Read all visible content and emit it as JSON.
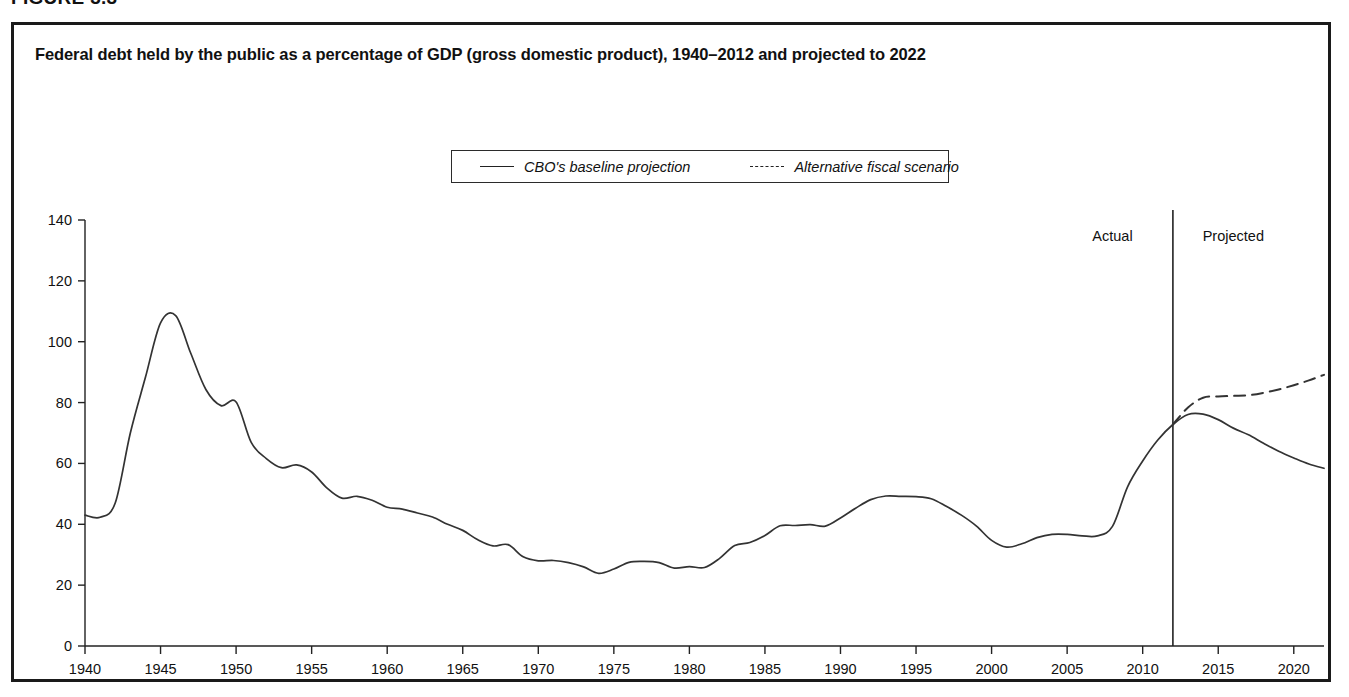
{
  "figure": {
    "number_label": "FIGURE 3.3",
    "title": "Federal debt held by the public as a percentage of GDP (gross domestic product), 1940–2012 and projected to 2022"
  },
  "legend": {
    "position": "top-center",
    "entries": [
      {
        "label": "CBO's baseline projection",
        "style": "solid",
        "color": "#333333"
      },
      {
        "label": "Alternative fiscal scenario",
        "style": "dashed",
        "color": "#333333"
      }
    ]
  },
  "annotations": {
    "actual_label": "Actual",
    "projected_label": "Projected",
    "divider_year": 2012
  },
  "chart_data": {
    "type": "line",
    "title": "Federal debt held by the public as a percentage of GDP (gross domestic product), 1940–2012 and projected to 2022",
    "xlabel": "",
    "ylabel": "",
    "xlim": [
      1940,
      2022
    ],
    "ylim": [
      0,
      140
    ],
    "grid": false,
    "legend_position": "top-center",
    "yticks": [
      0,
      20,
      40,
      60,
      80,
      100,
      120,
      140
    ],
    "ytick_labels": [
      "0",
      "20",
      "40",
      "60",
      "80",
      "100",
      "120",
      "140"
    ],
    "xticks": [
      1940,
      1945,
      1950,
      1955,
      1960,
      1965,
      1970,
      1975,
      1980,
      1985,
      1990,
      1995,
      2000,
      2005,
      2010,
      2015,
      2020
    ],
    "xtick_labels": [
      "1940",
      "1945",
      "1950",
      "1955",
      "1960",
      "1965",
      "1970",
      "1975",
      "1980",
      "1985",
      "1990",
      "1995",
      "2000",
      "2005",
      "2010",
      "2015",
      "2020"
    ],
    "annotations": [
      {
        "text": "Actual",
        "x": 2008,
        "y": 133
      },
      {
        "text": "Projected",
        "x": 2016,
        "y": 133
      },
      {
        "text": "divider",
        "x": 2012,
        "type": "vline"
      }
    ],
    "series": [
      {
        "name": "CBO's baseline projection",
        "style": "solid",
        "x": [
          1940,
          1941,
          1942,
          1943,
          1944,
          1945,
          1946,
          1947,
          1948,
          1949,
          1950,
          1951,
          1952,
          1953,
          1954,
          1955,
          1956,
          1957,
          1958,
          1959,
          1960,
          1961,
          1962,
          1963,
          1964,
          1965,
          1966,
          1967,
          1968,
          1969,
          1970,
          1971,
          1972,
          1973,
          1974,
          1975,
          1976,
          1977,
          1978,
          1979,
          1980,
          1981,
          1982,
          1983,
          1984,
          1985,
          1986,
          1987,
          1988,
          1989,
          1990,
          1991,
          1992,
          1993,
          1994,
          1995,
          1996,
          1997,
          1998,
          1999,
          2000,
          2001,
          2002,
          2003,
          2004,
          2005,
          2006,
          2007,
          2008,
          2009,
          2010,
          2011,
          2012,
          2013,
          2014,
          2015,
          2016,
          2017,
          2018,
          2019,
          2020,
          2021,
          2022
        ],
        "y": [
          43.0,
          42.3,
          47.0,
          70.0,
          88.3,
          106.2,
          108.6,
          96.2,
          84.3,
          79.0,
          80.2,
          66.9,
          61.6,
          58.6,
          59.5,
          57.2,
          52.0,
          48.6,
          49.2,
          47.9,
          45.6,
          45.0,
          43.7,
          42.4,
          40.0,
          38.0,
          34.9,
          32.9,
          33.3,
          29.3,
          28.0,
          28.1,
          27.4,
          26.0,
          23.9,
          25.3,
          27.5,
          27.8,
          27.4,
          25.6,
          26.1,
          25.8,
          28.8,
          33.0,
          34.0,
          36.3,
          39.5,
          39.6,
          39.9,
          39.4,
          42.1,
          45.3,
          48.1,
          49.3,
          49.2,
          49.1,
          48.4,
          45.9,
          43.0,
          39.4,
          34.7,
          32.5,
          33.6,
          35.6,
          36.7,
          36.7,
          36.2,
          36.2,
          39.3,
          52.3,
          60.8,
          67.7,
          72.8,
          76.1,
          76.2,
          74.4,
          71.6,
          69.4,
          66.6,
          64.0,
          61.8,
          59.8,
          58.4
        ]
      },
      {
        "name": "Alternative fiscal scenario",
        "style": "dashed",
        "x": [
          2012,
          2013,
          2014,
          2015,
          2016,
          2017,
          2018,
          2019,
          2020,
          2021,
          2022
        ],
        "y": [
          72.8,
          78.4,
          81.6,
          82.0,
          82.2,
          82.4,
          83.2,
          84.3,
          85.7,
          87.3,
          89.1
        ]
      }
    ]
  }
}
